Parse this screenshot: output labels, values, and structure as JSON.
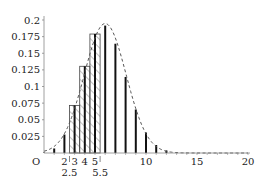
{
  "chart_data": {
    "type": "bar",
    "title": "",
    "xlabel": "",
    "ylabel": "",
    "origin_label": "O",
    "xlim": [
      0,
      20
    ],
    "ylim": [
      0,
      0.2
    ],
    "grid": false,
    "x_ticks": [
      10,
      15,
      20
    ],
    "x_tick_labels": [
      "10",
      "15",
      "20"
    ],
    "x_extra_labels_row1": [
      {
        "x": 2,
        "label": "2"
      },
      {
        "x": 3,
        "label": "3"
      },
      {
        "x": 4,
        "label": "4"
      },
      {
        "x": 5,
        "label": "5"
      }
    ],
    "x_extra_labels_row2": [
      {
        "x": 2.5,
        "label": "2.5"
      },
      {
        "x": 5.5,
        "label": "5.5"
      }
    ],
    "y_ticks": [
      0.025,
      0.05,
      0.075,
      0.1,
      0.125,
      0.15,
      0.175,
      0.2
    ],
    "y_tick_labels": [
      "0.025",
      "0.05",
      "0.075",
      "0.1",
      "0.125",
      "0.15",
      "0.175",
      "0.2"
    ],
    "series": [
      {
        "name": "probability mass (bars)",
        "type": "bar",
        "x": [
          0,
          1,
          2,
          3,
          4,
          5,
          6,
          7,
          8,
          9,
          10,
          11,
          12,
          13,
          14,
          15,
          16,
          17,
          18,
          19,
          20
        ],
        "values": [
          0.0008,
          0.0068,
          0.0278,
          0.0716,
          0.1304,
          0.1789,
          0.1916,
          0.1643,
          0.1144,
          0.0654,
          0.0308,
          0.012,
          0.0039,
          0.001,
          0.0002,
          0.0,
          0.0,
          0.0,
          0.0,
          0.0,
          0.0
        ]
      },
      {
        "name": "hatched area 2.5 to 5.5",
        "type": "hatched-rectangles",
        "x_from": 2.5,
        "x_to": 5.5,
        "x": [
          3,
          4,
          5
        ],
        "values": [
          0.0716,
          0.1304,
          0.1789
        ]
      },
      {
        "name": "normal approximation (dashed)",
        "type": "line",
        "style": "dashed",
        "mean": 6,
        "sd": 2.049
      }
    ],
    "legend": null
  },
  "colors": {
    "bars": "#111111",
    "hatch": "#555555",
    "curve": "#555555",
    "axis": "#888888"
  }
}
